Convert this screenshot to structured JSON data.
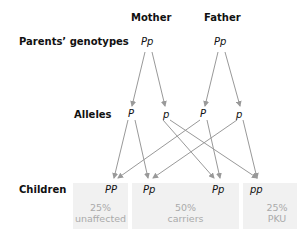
{
  "headers": {
    "mother": "Mother",
    "father": "Father"
  },
  "rows": {
    "parents": "Parents’ genotypes",
    "alleles": "Alleles",
    "children": "Children"
  },
  "parents": {
    "mother": "Pp",
    "father": "Pp"
  },
  "alleles": [
    "P",
    "p",
    "P",
    "p"
  ],
  "children": [
    "PP",
    "Pp",
    "Pp",
    "pp"
  ],
  "groups": [
    {
      "percent": "25%",
      "label": "unaffected"
    },
    {
      "percent": "50%",
      "label": "carriers"
    },
    {
      "percent": "25%",
      "label": "PKU"
    }
  ],
  "colors": {
    "arrow": "#999999",
    "box": "#f1f1f1",
    "muted": "#aaaaaa"
  }
}
